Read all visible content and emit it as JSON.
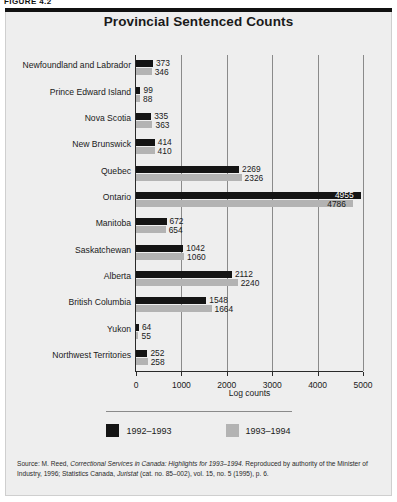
{
  "figure_caption": "FIGURE 4.2",
  "chart_title": "Provincial Sentenced Counts",
  "legend": {
    "series": [
      {
        "label": "1992–1993",
        "color": "#141414"
      },
      {
        "label": "1993–1994",
        "color": "#b3b3b3"
      }
    ]
  },
  "source": {
    "prefix": "Source: M. Reed, ",
    "italic1": "Correctional Services in Canada: Highlights for 1993–1994.",
    "mid": " Reproduced by authority of the Minister of Industry, 1996; Statistics Canada, ",
    "italic2": "Juristat",
    "suffix": " (cat. no. 85–002), vol. 15, no. 5 (1995), p. 6."
  },
  "chart_data": {
    "type": "bar",
    "orientation": "horizontal",
    "title": "Provincial Sentenced Counts",
    "xlabel": "Log counts",
    "ylabel": "",
    "xlim": [
      0,
      5000
    ],
    "xticks": [
      0,
      1000,
      2000,
      3000,
      4000,
      5000
    ],
    "xticklabels": [
      "0",
      "1000",
      "2000",
      "3000",
      "4000",
      "5000"
    ],
    "grid": true,
    "legend_position": "bottom",
    "categories": [
      "Newfoundland and Labrador",
      "Prince Edward Island",
      "Nova Scotia",
      "New Brunswick",
      "Quebec",
      "Ontario",
      "Manitoba",
      "Saskatchewan",
      "Alberta",
      "British Columbia",
      "Yukon",
      "Northwest Territories"
    ],
    "series": [
      {
        "name": "1992–1993",
        "color": "#141414",
        "values": [
          373,
          99,
          335,
          414,
          2269,
          4955,
          672,
          1042,
          2112,
          1548,
          64,
          252
        ]
      },
      {
        "name": "1993–1994",
        "color": "#b3b3b3",
        "values": [
          346,
          88,
          363,
          410,
          2326,
          4786,
          654,
          1060,
          2240,
          1664,
          55,
          258
        ]
      }
    ]
  }
}
